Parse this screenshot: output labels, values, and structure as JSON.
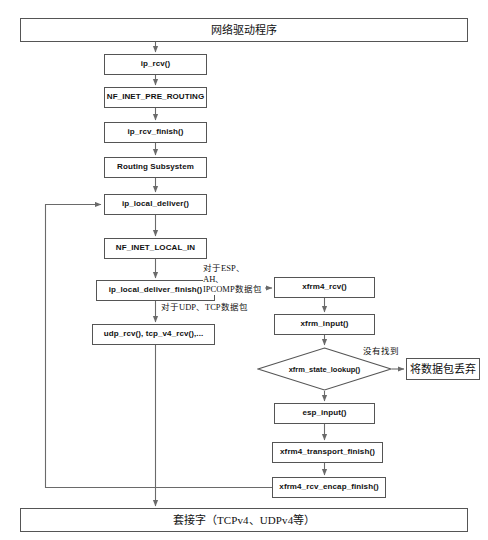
{
  "diagram": {
    "language": "zh-CN",
    "nodes": [
      {
        "id": "net_driver",
        "label": "网络驱动程序",
        "shape": "rect",
        "x": 20,
        "y": 18,
        "w": 448,
        "h": 24,
        "style": "cjk"
      },
      {
        "id": "ip_rcv",
        "label": "ip_rcv()",
        "shape": "rect",
        "x": 104,
        "y": 54,
        "w": 103,
        "h": 21,
        "style": "code"
      },
      {
        "id": "nf_pre_routing",
        "label": "NF_INET_PRE_ROUTING",
        "shape": "rect",
        "x": 104,
        "y": 87,
        "w": 103,
        "h": 21,
        "style": "code"
      },
      {
        "id": "ip_rcv_finish",
        "label": "ip_rcv_finish()",
        "shape": "rect",
        "x": 104,
        "y": 122,
        "w": 103,
        "h": 21,
        "style": "code"
      },
      {
        "id": "routing_subsystem",
        "label": "Routing Subsystem",
        "shape": "rect",
        "x": 104,
        "y": 157,
        "w": 103,
        "h": 21,
        "style": "code"
      },
      {
        "id": "ip_local_deliver",
        "label": "ip_local_deliver()",
        "shape": "rect",
        "x": 104,
        "y": 194,
        "w": 103,
        "h": 21,
        "style": "code"
      },
      {
        "id": "nf_local_in",
        "label": "NF_INET_LOCAL_IN",
        "shape": "rect",
        "x": 104,
        "y": 238,
        "w": 103,
        "h": 21,
        "style": "code"
      },
      {
        "id": "ip_local_deliver_fin",
        "label": "ip_local_deliver_finish()",
        "shape": "rect",
        "x": 96,
        "y": 280,
        "w": 119,
        "h": 21,
        "style": "code"
      },
      {
        "id": "udp_tcp_rcv",
        "label": "udp_rcv(), tcp_v4_rcv(),...",
        "shape": "rect",
        "x": 92,
        "y": 324,
        "w": 123,
        "h": 21,
        "style": "code"
      },
      {
        "id": "xfrm4_rcv",
        "label": "xfrm4_rcv()",
        "shape": "rect",
        "x": 274,
        "y": 277,
        "w": 101,
        "h": 21,
        "style": "code"
      },
      {
        "id": "xfrm_input",
        "label": "xfrm_input()",
        "shape": "rect",
        "x": 274,
        "y": 314,
        "w": 101,
        "h": 21,
        "style": "code"
      },
      {
        "id": "xfrm_state_lookup",
        "label": "xfrm_state_lookup()",
        "shape": "diamond",
        "x": 257,
        "y": 347,
        "w": 135,
        "h": 44,
        "style": "code"
      },
      {
        "id": "drop_packet",
        "label": "将数据包丢弃",
        "shape": "rect",
        "x": 406,
        "y": 358,
        "w": 74,
        "h": 22,
        "style": "cjk"
      },
      {
        "id": "esp_input",
        "label": "esp_input()",
        "shape": "rect",
        "x": 274,
        "y": 403,
        "w": 101,
        "h": 21,
        "style": "code"
      },
      {
        "id": "xfrm4_transport_fin",
        "label": "xfrm4_transport_finish()",
        "shape": "rect",
        "x": 272,
        "y": 442,
        "w": 111,
        "h": 21,
        "style": "code"
      },
      {
        "id": "xfrm4_rcv_encap_fin",
        "label": "xfrm4_rcv_encap_finish()",
        "shape": "rect",
        "x": 272,
        "y": 477,
        "w": 114,
        "h": 21,
        "style": "code"
      },
      {
        "id": "socket",
        "label": "套接字（TCPv4、UDPv4等）",
        "shape": "rect",
        "x": 20,
        "y": 508,
        "w": 448,
        "h": 24,
        "style": "cjk"
      }
    ],
    "edge_labels": [
      {
        "id": "label_esp",
        "text_line1": "对于ESP、AH、",
        "text_line2": "IPCOMP数据包",
        "x": 203,
        "y": 263
      },
      {
        "id": "label_udp_tcp",
        "text_line1": "对于UDP、TCP数据包",
        "text_line2": "",
        "x": 146,
        "y": 301
      },
      {
        "id": "label_not_found",
        "text_line1": "没有找到",
        "text_line2": "",
        "x": 363,
        "y": 348
      }
    ],
    "edges": [
      {
        "from": "net_driver",
        "to": "ip_rcv",
        "type": "straight-down"
      },
      {
        "from": "ip_rcv",
        "to": "nf_pre_routing",
        "type": "straight-down"
      },
      {
        "from": "nf_pre_routing",
        "to": "ip_rcv_finish",
        "type": "straight-down"
      },
      {
        "from": "ip_rcv_finish",
        "to": "routing_subsystem",
        "type": "straight-down"
      },
      {
        "from": "routing_subsystem",
        "to": "ip_local_deliver",
        "type": "straight-down"
      },
      {
        "from": "ip_local_deliver",
        "to": "nf_local_in",
        "type": "straight-down"
      },
      {
        "from": "nf_local_in",
        "to": "ip_local_deliver_fin",
        "type": "straight-down"
      },
      {
        "from": "ip_local_deliver_fin",
        "to": "udp_tcp_rcv",
        "type": "straight-down",
        "label": "label_udp_tcp"
      },
      {
        "from": "ip_local_deliver_fin",
        "to": "xfrm4_rcv",
        "type": "right",
        "label": "label_esp"
      },
      {
        "from": "udp_tcp_rcv",
        "to": "socket",
        "type": "straight-down"
      },
      {
        "from": "xfrm4_rcv",
        "to": "xfrm_input",
        "type": "straight-down"
      },
      {
        "from": "xfrm_input",
        "to": "xfrm_state_lookup",
        "type": "straight-down"
      },
      {
        "from": "xfrm_state_lookup",
        "to": "drop_packet",
        "type": "right",
        "label": "label_not_found"
      },
      {
        "from": "xfrm_state_lookup",
        "to": "esp_input",
        "type": "straight-down"
      },
      {
        "from": "esp_input",
        "to": "xfrm4_transport_fin",
        "type": "straight-down"
      },
      {
        "from": "xfrm4_transport_fin",
        "to": "xfrm4_rcv_encap_fin",
        "type": "straight-down"
      },
      {
        "from": "xfrm4_rcv_encap_fin",
        "to": "ip_local_deliver",
        "type": "feedback-left"
      }
    ],
    "colors": {
      "stroke": "#555555",
      "line": "#6a6a6a",
      "text": "#111111",
      "background": "#ffffff"
    }
  }
}
